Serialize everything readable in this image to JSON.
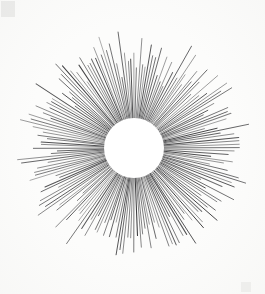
{
  "artwork": {
    "title": "Sunburst Starburst Radial Line Drawing",
    "medium_note": "Ink on paper scan",
    "canvas": {
      "width": 265,
      "height": 294,
      "background_color": "#fcfcfb"
    },
    "center": {
      "cx": 134,
      "cy": 148,
      "label": "radial origin"
    },
    "core_disc": {
      "name": "blank white circle",
      "radius": 30,
      "fill_color": "#ffffff",
      "stroke": "none"
    },
    "rays": {
      "count": 184,
      "inner_radius": 30,
      "min_outer_radius": 68,
      "max_outer_radius": 117,
      "stroke_color": "#3a3a3c",
      "stroke_width_base": 0.85,
      "taper": "pointed tips",
      "angular_spacing_degrees": 1.96,
      "length_pattern": "irregular alternating long and short spokes"
    },
    "vignette": {
      "enabled": true,
      "edge_tone": "#f4f4f2"
    },
    "smudges": [
      {
        "position": "top-left",
        "color": "#d7d7d5"
      },
      {
        "position": "bottom-right",
        "color": "#e4e4e2"
      }
    ]
  }
}
